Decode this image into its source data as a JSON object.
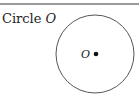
{
  "figure": {
    "caption_prefix": "Circle",
    "caption_name": "O",
    "center_label": "O"
  },
  "colors": {
    "rule": "#9a9a9a",
    "stroke": "#555555",
    "text": "#222222"
  }
}
